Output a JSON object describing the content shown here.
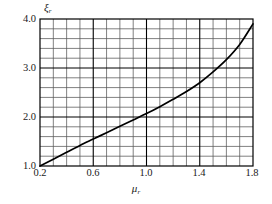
{
  "chart_data": {
    "type": "line",
    "title": "",
    "subtitle": "",
    "xlabel": "μ",
    "xlabel_sub": "r",
    "ylabel": "ξ",
    "ylabel_sub": "r",
    "xlim": [
      0.2,
      1.8
    ],
    "ylim": [
      1.0,
      4.0
    ],
    "grid": true,
    "legend": "none",
    "xticks": [
      "0.2",
      "0.6",
      "1.0",
      "1.4",
      "1.8"
    ],
    "xtick_values": [
      0.2,
      0.6,
      1.0,
      1.4,
      1.8
    ],
    "yticks": [
      "1.0",
      "2.0",
      "3.0",
      "4.0"
    ],
    "ytick_values": [
      1.0,
      2.0,
      3.0,
      4.0
    ],
    "x_minor_step": 0.1,
    "y_minor_step": 0.2,
    "series": [
      {
        "name": "curve",
        "color": "#000000",
        "x": [
          0.2,
          0.3,
          0.4,
          0.5,
          0.6,
          0.7,
          0.8,
          0.9,
          1.0,
          1.1,
          1.2,
          1.3,
          1.4,
          1.5,
          1.6,
          1.7,
          1.8
        ],
        "values": [
          1.0,
          1.14,
          1.28,
          1.42,
          1.55,
          1.68,
          1.81,
          1.94,
          2.07,
          2.21,
          2.36,
          2.52,
          2.7,
          2.92,
          3.17,
          3.48,
          3.9
        ]
      }
    ]
  },
  "axes_geometry": {
    "plot_left": 40,
    "plot_top": 19,
    "plot_right": 253,
    "plot_bottom": 166
  }
}
